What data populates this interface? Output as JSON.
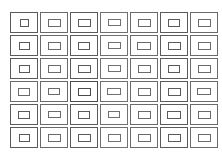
{
  "figure": {
    "width": 222,
    "height": 156,
    "background_color": "#ffffff",
    "stroke_color": "#4a4a4a",
    "stroke_color_light": "#8a8a8a",
    "stroke_width": 1
  },
  "grid": {
    "columns": 7,
    "rows": 6,
    "total_cells": 42,
    "offset_left": 9,
    "offset_top": 11,
    "cell_width": 30,
    "cell_height": 23,
    "column_gap": 0,
    "row_gap": 0,
    "outer_rect": {
      "width": 28,
      "height": 21,
      "border_width": 1
    },
    "inner_rect": {
      "width": 12,
      "height": 8,
      "border_width": 1
    }
  },
  "cells": [
    {
      "row": 1,
      "col": 1,
      "inner_w": 9,
      "inner_h": 8,
      "shade": "#5a5a5a"
    },
    {
      "row": 1,
      "col": 2,
      "inner_w": 13,
      "inner_h": 8,
      "shade": "#6a6a6a"
    },
    {
      "row": 1,
      "col": 3,
      "inner_w": 13,
      "inner_h": 8,
      "shade": "#5a5a5a"
    },
    {
      "row": 1,
      "col": 4,
      "inner_w": 13,
      "inner_h": 7,
      "shade": "#707070"
    },
    {
      "row": 1,
      "col": 5,
      "inner_w": 13,
      "inner_h": 8,
      "shade": "#6a6a6a"
    },
    {
      "row": 1,
      "col": 6,
      "inner_w": 12,
      "inner_h": 8,
      "shade": "#5a5a5a"
    },
    {
      "row": 1,
      "col": 7,
      "inner_w": 13,
      "inner_h": 8,
      "shade": "#6a6a6a"
    },
    {
      "row": 2,
      "col": 1,
      "inner_w": 11,
      "inner_h": 8,
      "shade": "#5a5a5a"
    },
    {
      "row": 2,
      "col": 2,
      "inner_w": 13,
      "inner_h": 8,
      "shade": "#6a6a6a"
    },
    {
      "row": 2,
      "col": 3,
      "inner_w": 12,
      "inner_h": 8,
      "shade": "#5a5a5a"
    },
    {
      "row": 2,
      "col": 4,
      "inner_w": 13,
      "inner_h": 7,
      "shade": "#707070"
    },
    {
      "row": 2,
      "col": 5,
      "inner_w": 14,
      "inner_h": 8,
      "shade": "#6a6a6a"
    },
    {
      "row": 2,
      "col": 6,
      "inner_w": 13,
      "inner_h": 8,
      "shade": "#5a5a5a"
    },
    {
      "row": 2,
      "col": 7,
      "inner_w": 13,
      "inner_h": 8,
      "shade": "#6a6a6a"
    },
    {
      "row": 3,
      "col": 1,
      "inner_w": 11,
      "inner_h": 8,
      "shade": "#5a5a5a"
    },
    {
      "row": 3,
      "col": 2,
      "inner_w": 13,
      "inner_h": 8,
      "shade": "#6a6a6a"
    },
    {
      "row": 3,
      "col": 3,
      "inner_w": 13,
      "inner_h": 8,
      "shade": "#5a5a5a"
    },
    {
      "row": 3,
      "col": 4,
      "inner_w": 13,
      "inner_h": 7,
      "shade": "#707070"
    },
    {
      "row": 3,
      "col": 5,
      "inner_w": 13,
      "inner_h": 8,
      "shade": "#6a6a6a"
    },
    {
      "row": 3,
      "col": 6,
      "inner_w": 12,
      "inner_h": 8,
      "shade": "#5a5a5a"
    },
    {
      "row": 3,
      "col": 7,
      "inner_w": 13,
      "inner_h": 8,
      "shade": "#6a6a6a"
    },
    {
      "row": 4,
      "col": 1,
      "inner_w": 12,
      "inner_h": 8,
      "shade": "#6a6a6a"
    },
    {
      "row": 4,
      "col": 2,
      "inner_w": 12,
      "inner_h": 7,
      "shade": "#6a6a6a"
    },
    {
      "row": 4,
      "col": 3,
      "inner_w": 13,
      "inner_h": 8,
      "shade": "#4a4a4a"
    },
    {
      "row": 4,
      "col": 4,
      "inner_w": 14,
      "inner_h": 7,
      "shade": "#707070"
    },
    {
      "row": 4,
      "col": 5,
      "inner_w": 13,
      "inner_h": 8,
      "shade": "#6a6a6a"
    },
    {
      "row": 4,
      "col": 6,
      "inner_w": 13,
      "inner_h": 8,
      "shade": "#5a5a5a"
    },
    {
      "row": 4,
      "col": 7,
      "inner_w": 14,
      "inner_h": 7,
      "shade": "#6a6a6a"
    },
    {
      "row": 5,
      "col": 1,
      "inner_w": 12,
      "inner_h": 8,
      "shade": "#5a5a5a"
    },
    {
      "row": 5,
      "col": 2,
      "inner_w": 13,
      "inner_h": 7,
      "shade": "#6a6a6a"
    },
    {
      "row": 5,
      "col": 3,
      "inner_w": 12,
      "inner_h": 8,
      "shade": "#5a5a5a"
    },
    {
      "row": 5,
      "col": 4,
      "inner_w": 12,
      "inner_h": 7,
      "shade": "#707070"
    },
    {
      "row": 5,
      "col": 5,
      "inner_w": 13,
      "inner_h": 8,
      "shade": "#6a6a6a"
    },
    {
      "row": 5,
      "col": 6,
      "inner_w": 14,
      "inner_h": 8,
      "shade": "#5a5a5a"
    },
    {
      "row": 5,
      "col": 7,
      "inner_w": 13,
      "inner_h": 8,
      "shade": "#6a6a6a"
    },
    {
      "row": 6,
      "col": 1,
      "inner_w": 11,
      "inner_h": 8,
      "shade": "#5a5a5a"
    },
    {
      "row": 6,
      "col": 2,
      "inner_w": 13,
      "inner_h": 8,
      "shade": "#6a6a6a"
    },
    {
      "row": 6,
      "col": 3,
      "inner_w": 13,
      "inner_h": 8,
      "shade": "#5a5a5a"
    },
    {
      "row": 6,
      "col": 4,
      "inner_w": 13,
      "inner_h": 8,
      "shade": "#707070"
    },
    {
      "row": 6,
      "col": 5,
      "inner_w": 13,
      "inner_h": 8,
      "shade": "#6a6a6a"
    },
    {
      "row": 6,
      "col": 6,
      "inner_w": 13,
      "inner_h": 8,
      "shade": "#5a5a5a"
    },
    {
      "row": 6,
      "col": 7,
      "inner_w": 13,
      "inner_h": 8,
      "shade": "#6a6a6a"
    }
  ]
}
